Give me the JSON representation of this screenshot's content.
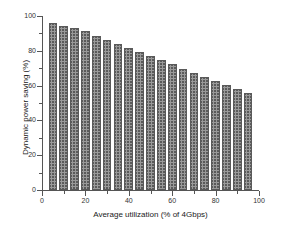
{
  "chart_data": {
    "type": "bar",
    "title": "",
    "xlabel": "Average utilization (% of 4Gbps)",
    "ylabel": "Dynamic power saving (%)",
    "xlim": [
      0,
      100
    ],
    "ylim": [
      0,
      100
    ],
    "grid": false,
    "legend": null,
    "x_ticks": [
      0,
      20,
      40,
      60,
      80,
      100
    ],
    "x_tick_labels": [
      "0",
      "20",
      "40",
      "60",
      "80",
      "100"
    ],
    "x_minor_ticks": [
      10,
      30,
      50,
      70,
      90
    ],
    "y_ticks": [
      0,
      20,
      40,
      60,
      80,
      100
    ],
    "y_tick_labels": [
      "0",
      "20",
      "40",
      "60",
      "80",
      "100"
    ],
    "y_minor_ticks": [
      10,
      30,
      50,
      70,
      90
    ],
    "bar_width": 4,
    "bar_fill": "#9a9a9a",
    "bar_edge": "#5a5a5a",
    "bar_pattern": "cross-hatch",
    "categories": [
      5,
      10,
      15,
      20,
      25,
      30,
      35,
      40,
      45,
      50,
      55,
      60,
      65,
      70,
      75,
      80,
      85,
      90,
      95
    ],
    "values": [
      95.8,
      94.5,
      93.0,
      91.2,
      88.8,
      86.5,
      84.2,
      81.8,
      79.5,
      77.3,
      74.8,
      72.3,
      69.8,
      67.5,
      65.2,
      62.7,
      60.4,
      58.0,
      55.5
    ],
    "bars": [
      {
        "x": 5,
        "value": 95.8
      },
      {
        "x": 10,
        "value": 94.5
      },
      {
        "x": 15,
        "value": 93.0
      },
      {
        "x": 20,
        "value": 91.2
      },
      {
        "x": 25,
        "value": 88.8
      },
      {
        "x": 30,
        "value": 86.5
      },
      {
        "x": 35,
        "value": 84.2
      },
      {
        "x": 40,
        "value": 81.8
      },
      {
        "x": 45,
        "value": 79.5
      },
      {
        "x": 50,
        "value": 77.3
      },
      {
        "x": 55,
        "value": 74.8
      },
      {
        "x": 60,
        "value": 72.3
      },
      {
        "x": 65,
        "value": 69.8
      },
      {
        "x": 70,
        "value": 67.5
      },
      {
        "x": 75,
        "value": 65.2
      },
      {
        "x": 80,
        "value": 62.7
      },
      {
        "x": 85,
        "value": 60.4
      },
      {
        "x": 90,
        "value": 58.0
      },
      {
        "x": 95,
        "value": 55.5
      }
    ]
  }
}
